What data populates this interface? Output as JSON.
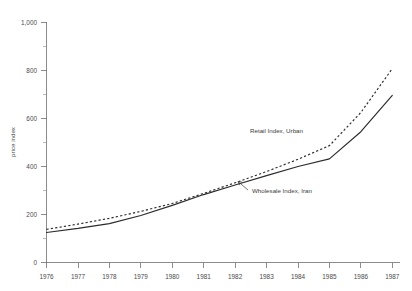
{
  "chart_data": {
    "type": "line",
    "title": "",
    "subtitle": "",
    "xlabel": "",
    "ylabel": "price index",
    "x": [
      1976,
      1977,
      1978,
      1979,
      1980,
      1981,
      1982,
      1983,
      1984,
      1985,
      1986,
      1987
    ],
    "categories": [
      "1976",
      "1977",
      "1978",
      "1979",
      "1980",
      "1981",
      "1982",
      "1983",
      "1984",
      "1985",
      "1986",
      "1987"
    ],
    "xlim": [
      1976,
      1987
    ],
    "ylim": [
      0,
      1000
    ],
    "yticks": [
      0,
      200,
      400,
      600,
      800,
      1000
    ],
    "ytick_labels": [
      "0",
      "200",
      "400",
      "600",
      "800",
      "1,000"
    ],
    "yminor_ticks": [
      100,
      300,
      500,
      700,
      900
    ],
    "grid": false,
    "legend": "inline-annotations",
    "series": [
      {
        "name": "Wholesale Index, Iran",
        "style": "solid",
        "color": "#2b2b2b",
        "values": [
          125,
          142,
          162,
          196,
          238,
          283,
          323,
          362,
          400,
          432,
          545,
          696
        ]
      },
      {
        "name": "Retail Index, Urban",
        "style": "dashed",
        "color": "#2b2b2b",
        "values": [
          138,
          160,
          184,
          213,
          246,
          288,
          332,
          379,
          430,
          487,
          625,
          808
        ]
      }
    ],
    "annotations": [
      {
        "text": "Retail Index, Urban",
        "series": "Retail Index, Urban",
        "label_x": 250,
        "label_y": 131,
        "leader_from_x": 247,
        "leader_from_y": 133,
        "leader_to_x": 243,
        "leader_to_y": 139
      },
      {
        "text": "Wholesale Index, Iran",
        "series": "Wholesale Index, Iran",
        "label_x": 251,
        "label_y": 192,
        "leader_from_x": 249,
        "leader_from_y": 189,
        "leader_to_x": 240,
        "leader_to_y": 182
      }
    ]
  },
  "axes": {
    "y_axis_label": "price index",
    "y_tick_labels": [
      "1,000",
      "800",
      "600",
      "400",
      "200",
      "0"
    ],
    "x_tick_labels": [
      "1976",
      "1977",
      "1978",
      "1979",
      "1980",
      "1981",
      "1982",
      "1983",
      "1984",
      "1985",
      "1986",
      "1987"
    ]
  },
  "annotation_texts": {
    "retail": "Retail Index, Urban",
    "wholesale": "Wholesale Index, Iran"
  }
}
